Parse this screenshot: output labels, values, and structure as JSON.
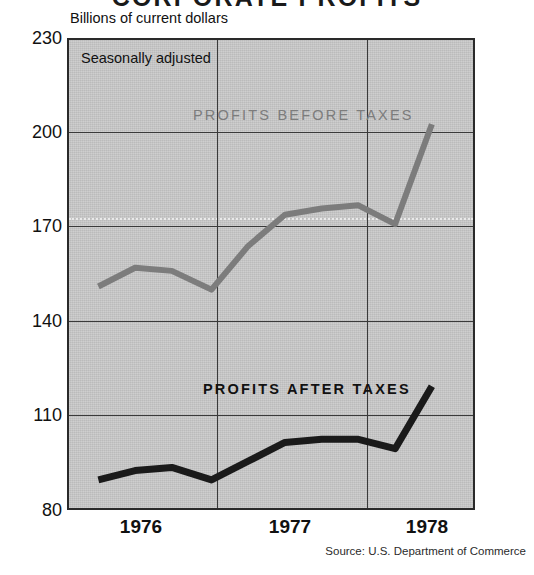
{
  "chart_data": {
    "type": "line",
    "title": "CORPORATE PROFITS",
    "subtitle": "Billions of current dollars",
    "annotation": "Seasonally adjusted",
    "source": "Source: U.S. Department of Commerce",
    "xlabel": "",
    "ylabel": "Billions of current dollars",
    "ylim": [
      80,
      230
    ],
    "xlim": [
      1975.75,
      1978.5
    ],
    "yticks": [
      230,
      200,
      170,
      140,
      110,
      80
    ],
    "xticks": [
      1976,
      1977,
      1978
    ],
    "xtick_labels": [
      "1976",
      "1977",
      "1978"
    ],
    "grid": true,
    "gridlines_vertical_at": [
      1976.5,
      1977.5
    ],
    "dotted_reference_line": 172,
    "legend": "inline-labels",
    "series": [
      {
        "name": "PROFITS BEFORE TAXES",
        "color": "#7c7c7c",
        "label_color": "#7c7c7c",
        "x": [
          1975.95,
          1976.2,
          1976.45,
          1976.72,
          1976.97,
          1977.22,
          1977.47,
          1977.72,
          1977.97,
          1978.22
        ],
        "values": [
          151,
          157,
          156,
          150,
          164,
          174,
          176,
          177,
          171,
          203
        ]
      },
      {
        "name": "PROFITS AFTER TAXES",
        "color": "#1a1a1a",
        "label_color": "#111111",
        "x": [
          1975.95,
          1976.2,
          1976.45,
          1976.72,
          1976.97,
          1977.22,
          1977.47,
          1977.72,
          1977.97,
          1978.22
        ],
        "values": [
          89,
          92,
          93,
          89,
          95,
          101,
          102,
          102,
          99,
          119
        ]
      }
    ]
  },
  "axis": {
    "caption": "Billions of current dollars",
    "ytick_labels": [
      "230",
      "200",
      "170",
      "140",
      "110",
      "80"
    ],
    "xtick_labels": [
      "1976",
      "1977",
      "1978"
    ]
  },
  "labels": {
    "seasonally_adjusted": "Seasonally adjusted",
    "series_before": "PROFITS BEFORE TAXES",
    "series_after": "PROFITS AFTER TAXES"
  },
  "footer": {
    "source": "Source: U.S. Department of Commerce"
  },
  "header": {
    "title": "CORPORATE PROFITS"
  },
  "colors": {
    "plot_background": "#c9c9c9",
    "page_background": "#ffffff",
    "before_taxes_line": "#7c7c7c",
    "after_taxes_line": "#1a1a1a",
    "frame": "#2a2a2a"
  }
}
